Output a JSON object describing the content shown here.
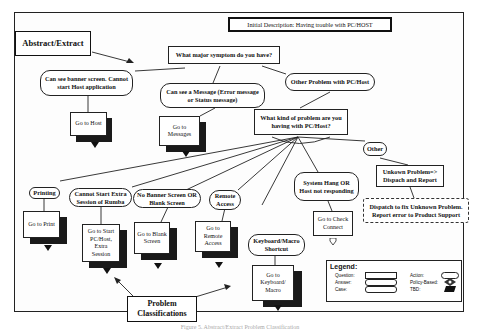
{
  "diagram": {
    "title": "Initial Description: Having trouble with PC/HOST",
    "labels": {
      "abstract_extract": "Abstract/Extract",
      "problem_classifications": "Problem Classifications"
    },
    "questions": {
      "major_symptom": "What major symptom do you have?",
      "kind_of_problem": "What kind of problem are you having with PC/Host?"
    },
    "answers": {
      "banner_screen": "Can see banner screen. Cannot start Host application",
      "see_message": "Can see a Message (Error message or Status message)",
      "other_problem": "Other Problem with PC/Host",
      "printing": "Printing",
      "extra_session": "Cannot Start Extra Session of Rumba",
      "no_banner": "No Banner Screen OR Blank Screen",
      "remote_access": "Remote Access",
      "system_hang": "System Hang OR Host not responding",
      "keyboard_macro": "Keyboard/Macro Shortcut",
      "other": "Other"
    },
    "actions": {
      "go_host": "Go to Host",
      "go_messages": "Go to Messages",
      "go_print": "Go to Print",
      "go_extra_session": "Go to Start PC/Host, Extra Session",
      "go_blank_screen": "Go to Blank Screen",
      "go_remote_access": "Go to Remote Access",
      "go_check_connect": "Go to Check Connect",
      "go_keyboard_macro": "Go to Keyboard/ Macro",
      "unknown_problem": "Unkown Problem=> Dispach and Report",
      "dispatch_unknown": "Dispatch to fix Unknown Problem. Report error to Product Support"
    },
    "legend": {
      "title": "Legend:",
      "question": "Question:",
      "answer": "Answer:",
      "case": "Case:",
      "action": "Action:",
      "policy_based": "Policy-Based:",
      "tbd": "TBD:"
    },
    "caption": "Figure 5. Abstract/Extract Problem Classification"
  }
}
